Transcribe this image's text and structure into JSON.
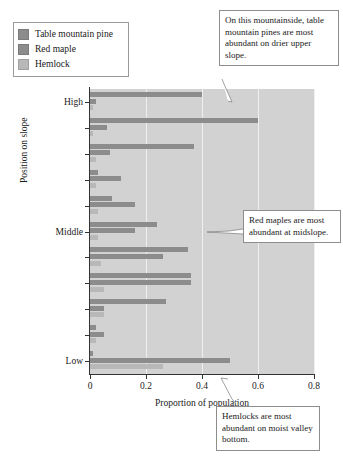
{
  "legend": {
    "items": [
      {
        "label": "Table mountain pine",
        "color": "#8c8c8c"
      },
      {
        "label": "Red maple",
        "color": "#8c8c8c"
      },
      {
        "label": "Hemlock",
        "color": "#b8b8b8"
      }
    ]
  },
  "annotations": [
    {
      "id": "pine",
      "text": "On this mountainside, table mountain pines are most abundant on drier upper slope."
    },
    {
      "id": "maple",
      "text": "Red maples are most abundant at midslope."
    },
    {
      "id": "hemlock",
      "text": "Hemlocks are most abundant on moist valley bottom."
    }
  ],
  "chart_data": {
    "type": "bar",
    "orientation": "horizontal",
    "title": "",
    "xlabel": "Proportion of population",
    "ylabel": "Position on slope",
    "xlim": [
      0,
      0.8
    ],
    "xticks": [
      0,
      0.2,
      0.4,
      0.6,
      0.8
    ],
    "xtick_labels": [
      "0",
      "0.2",
      "0.4",
      "0.6",
      "0.8"
    ],
    "ytick_labels": [
      "High",
      "",
      "",
      "",
      "",
      "Middle",
      "",
      "",
      "",
      "",
      "Low"
    ],
    "grid": true,
    "legend_position": "top-left-outside",
    "categories": [
      "slope-position-1",
      "slope-position-2",
      "slope-position-3",
      "slope-position-4",
      "slope-position-5",
      "slope-position-6",
      "slope-position-7",
      "slope-position-8",
      "slope-position-9",
      "slope-position-10",
      "slope-position-11"
    ],
    "series": [
      {
        "name": "Table mountain pine",
        "color": "#8c8c8c",
        "values": [
          0.4,
          0.6,
          0.37,
          0.03,
          0.08,
          0.24,
          0.35,
          0.36,
          0.27,
          0.02,
          0.01
        ]
      },
      {
        "name": "Red maple",
        "color": "#8c8c8c",
        "values": [
          0.02,
          0.06,
          0.07,
          0.11,
          0.16,
          0.16,
          0.26,
          0.36,
          0.05,
          0.05,
          0.5
        ]
      },
      {
        "name": "Hemlock",
        "color": "#b8b8b8",
        "values": [
          0.01,
          0.01,
          0.02,
          0.02,
          0.03,
          0.03,
          0.04,
          0.05,
          0.05,
          0.02,
          0.26
        ]
      }
    ]
  }
}
